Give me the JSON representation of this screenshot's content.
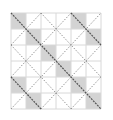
{
  "diagram": {
    "type": "quilt-pattern-grid",
    "grid": {
      "cols": 6,
      "rows": 6,
      "left": 11,
      "top": 13,
      "cell_w": 15,
      "cell_h": 16
    },
    "shaded_cells": [
      [
        0,
        0
      ],
      [
        4,
        0
      ],
      [
        1,
        1
      ],
      [
        5,
        1
      ],
      [
        2,
        2
      ],
      [
        3,
        3
      ],
      [
        0,
        4
      ],
      [
        4,
        4
      ],
      [
        1,
        5
      ],
      [
        5,
        5
      ]
    ],
    "backslash_diagonals": [
      {
        "offset": -4,
        "style": "dark"
      },
      {
        "offset": -2,
        "style": "light"
      },
      {
        "offset": 0,
        "style": "dark"
      },
      {
        "offset": 2,
        "style": "light"
      },
      {
        "offset": 4,
        "style": "dark"
      }
    ],
    "slash_diagonals": [
      2,
      4,
      6,
      8,
      10
    ],
    "colors": {
      "background": "#ffffff",
      "grid_line": "#d8d8d8",
      "shade": "#d3d3d3",
      "dark_line": "#555555",
      "light_line": "#8a8a8a"
    }
  }
}
